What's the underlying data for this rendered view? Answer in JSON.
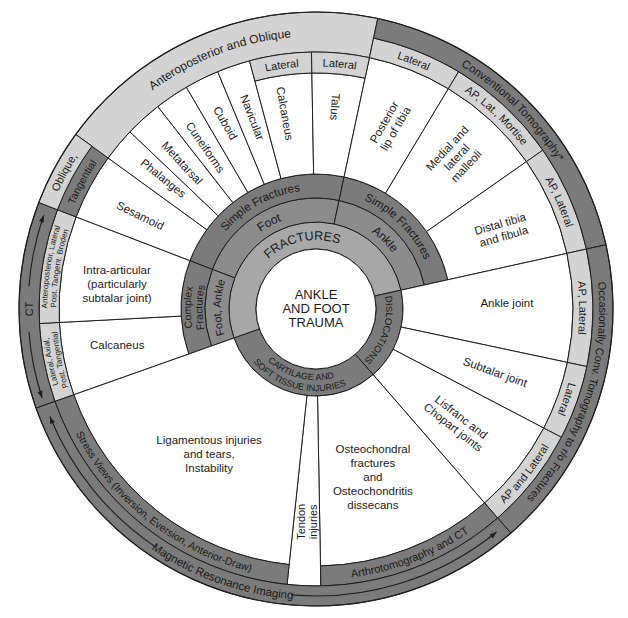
{
  "diagram": {
    "title": [
      "ANKLE",
      "AND FOOT",
      "TRAUMA"
    ],
    "colors": {
      "dark": "#7b7b7b",
      "medium": "#8c8c8c",
      "fractures": "#a7a7a7",
      "light": "#d3d3d3",
      "white": "#ffffff",
      "stroke": "#1e1e1e",
      "text": "#1a1a1a"
    },
    "injury_categories": [
      {
        "id": "fractures",
        "label": [
          "FRACTURES"
        ],
        "r": [
          "center",
          "core"
        ],
        "a": [
          250.5,
          437.5
        ],
        "fill": "fractures",
        "text": {
          "dir": "cw",
          "angle": 348,
          "size": 12.5
        }
      },
      {
        "id": "dislocations",
        "label": [
          "DISLOCATIONS"
        ],
        "r": [
          "center",
          "core"
        ],
        "a": [
          77.5,
          139
        ],
        "fill": "dark",
        "text": {
          "dir": "cw",
          "size": 9.5
        }
      },
      {
        "id": "cartilage-soft-tissue",
        "label": [
          "CARTILAGE AND",
          "SOFT TISSUE INJURIES"
        ],
        "r": [
          "center",
          "core"
        ],
        "a": [
          139,
          250.5
        ],
        "fill": "dark",
        "text": {
          "dir": "ccw",
          "angle": 194,
          "size": 9,
          "lh": 11
        }
      }
    ],
    "sites": [
      {
        "id": "foot-ankle-complex",
        "label": [
          "Foot, Ankle"
        ],
        "r": [
          "core",
          "site"
        ],
        "a": [
          250.5,
          291
        ],
        "fill": "medium",
        "text": {
          "dir": "cw",
          "size": 11
        }
      },
      {
        "id": "foot",
        "label": [
          "Foot"
        ],
        "r": [
          "core",
          "site"
        ],
        "a": [
          291,
          372
        ],
        "fill": "medium",
        "text": {
          "dir": "cw",
          "size": 12
        }
      },
      {
        "id": "ankle",
        "label": [
          "Ankle"
        ],
        "r": [
          "core",
          "site"
        ],
        "a": [
          372,
          437.5
        ],
        "fill": "medium",
        "text": {
          "dir": "cw",
          "size": 12
        }
      }
    ],
    "fracture_types": [
      {
        "id": "complex-fractures",
        "label": [
          "Complex",
          "Fractures"
        ],
        "r": [
          "site",
          "type"
        ],
        "a": [
          250.5,
          291
        ],
        "fill": "dark",
        "text": {
          "dir": "cw",
          "size": 10.5,
          "lh": 11.5
        }
      },
      {
        "id": "simple-fractures-foot",
        "label": [
          "Simple Fractures"
        ],
        "r": [
          "site",
          "type"
        ],
        "a": [
          291,
          372
        ],
        "fill": "dark",
        "text": {
          "dir": "cw",
          "size": 11.5
        }
      },
      {
        "id": "simple-fractures-ankle",
        "label": [
          "Simple Fractures"
        ],
        "r": [
          "site",
          "type"
        ],
        "a": [
          372,
          437.5
        ],
        "fill": "dark",
        "text": {
          "dir": "cw",
          "size": 11.5
        }
      }
    ],
    "injuries": [
      {
        "id": "calcaneus-complex",
        "label": [
          "Calcaneus"
        ],
        "r": [
          "type",
          "content"
        ],
        "a": [
          250.5,
          267
        ],
        "fill": "white",
        "text": {
          "mode": "rot",
          "angle": 259.75,
          "r": 202,
          "rot": 0
        }
      },
      {
        "id": "intra-articular",
        "label": [
          "Intra-articular",
          "(particularly",
          "subtalar joint)"
        ],
        "r": [
          "type",
          "content"
        ],
        "a": [
          267,
          291
        ],
        "fill": "white",
        "text": {
          "mode": "rot",
          "angle": 277.2,
          "r": 200.6,
          "rot": 0,
          "lh": 14
        }
      },
      {
        "id": "sesamoid",
        "label": [
          "Sesamoid"
        ],
        "r": [
          "type",
          "content"
        ],
        "a": [
          291,
          306
        ],
        "fill": "white",
        "text": {
          "mode": "rot",
          "angle": 298,
          "r": 199,
          "rot": 26
        }
      },
      {
        "id": "phalanges",
        "label": [
          "Phalanges"
        ],
        "r": [
          "type",
          "content"
        ],
        "a": [
          306,
          313.6
        ],
        "fill": "white",
        "text": {
          "mode": "rot",
          "angle": 310.6,
          "r": 201,
          "rot": 39
        }
      },
      {
        "id": "metatarsal",
        "label": [
          "Metatarsal"
        ],
        "r": [
          "type",
          "content"
        ],
        "a": [
          313.6,
          322
        ],
        "fill": "white",
        "text": {
          "mode": "rot",
          "angle": 317.5,
          "r": 198,
          "rot": 47
        }
      },
      {
        "id": "cuneiforms",
        "label": [
          "Cuneiforms"
        ],
        "r": [
          "type",
          "content"
        ],
        "a": [
          322,
          329.7
        ],
        "fill": "white",
        "text": {
          "mode": "rot",
          "angle": 325.6,
          "r": 196,
          "rot": 55
        }
      },
      {
        "id": "cuboid",
        "label": [
          "Cuboid"
        ],
        "r": [
          "type",
          "content"
        ],
        "a": [
          329.7,
          337.5
        ],
        "fill": "white",
        "text": {
          "mode": "rot",
          "angle": 334,
          "r": 207,
          "rot": 60
        }
      },
      {
        "id": "navicular",
        "label": [
          "Navicular"
        ],
        "r": [
          "type",
          "content"
        ],
        "a": [
          337.5,
          345
        ],
        "fill": "white",
        "text": {
          "mode": "rot",
          "angle": 341.6,
          "r": 202,
          "rot": 69
        }
      },
      {
        "id": "calcaneus",
        "label": [
          "Calcaneus"
        ],
        "r": [
          "type",
          "lat"
        ],
        "a": [
          345,
          359
        ],
        "fill": "white",
        "text": {
          "mode": "rot",
          "angle": 351,
          "r": 198,
          "rot": 80
        }
      },
      {
        "id": "talus",
        "label": [
          "Talus"
        ],
        "r": [
          "type",
          "lat"
        ],
        "a": [
          359,
          372
        ],
        "fill": "white",
        "text": {
          "mode": "rot",
          "angle": 5.4,
          "r": 203,
          "rot": 94
        }
      },
      {
        "id": "posterior-lip-of-tibia",
        "label": [
          "Posterior",
          "lip of tibia"
        ],
        "r": [
          "type",
          "content"
        ],
        "a": [
          372,
          391
        ],
        "fill": "white",
        "text": {
          "mode": "rot",
          "angle": 21.9,
          "r": 198,
          "rot": -60,
          "lh": 13
        }
      },
      {
        "id": "medial-lateral-malleoli",
        "label": [
          "Medial and",
          "lateral",
          "malleoli"
        ],
        "r": [
          "type",
          "content"
        ],
        "a": [
          391,
          415
        ],
        "fill": "white",
        "text": {
          "mode": "rot",
          "angle": 42.8,
          "r": 207,
          "rot": -47,
          "lh": 13
        }
      },
      {
        "id": "distal-tibia-fibula",
        "label": [
          "Distal tibia",
          "and fibula"
        ],
        "r": [
          "type",
          "content"
        ],
        "a": [
          415,
          437.5
        ],
        "fill": "white",
        "text": {
          "mode": "rot",
          "angle": 67,
          "r": 202,
          "rot": -16,
          "lh": 13
        }
      },
      {
        "id": "ankle-joint",
        "label": [
          "Ankle joint"
        ],
        "r": [
          "core",
          "content"
        ],
        "a": [
          77.5,
          102
        ],
        "fill": "white",
        "text": {
          "mode": "rot",
          "angle": 88.2,
          "r": 191,
          "rot": 0
        }
      },
      {
        "id": "subtalar-joint",
        "label": [
          "Subtalar joint"
        ],
        "r": [
          "core",
          "content"
        ],
        "a": [
          102,
          117.6
        ],
        "fill": "white",
        "text": {
          "mode": "rot",
          "angle": 109.4,
          "r": 190,
          "rot": 20
        }
      },
      {
        "id": "lisfranc-chopart-joints",
        "label": [
          "Lisfranc and",
          "Chopart joints"
        ],
        "r": [
          "core",
          "content"
        ],
        "a": [
          117.6,
          139
        ],
        "fill": "white",
        "text": {
          "mode": "rot",
          "angle": 128.7,
          "r": 181,
          "rot": 38,
          "lh": 13
        }
      },
      {
        "id": "osteochondral",
        "label": [
          "Osteochondral",
          "fractures",
          "and",
          "Osteochondritis",
          "dissecans"
        ],
        "r": [
          "core",
          "content"
        ],
        "a": [
          139,
          179
        ],
        "fill": "white",
        "text": {
          "mode": "rot",
          "angle": 161.3,
          "r": 177.4,
          "rot": 0,
          "lh": 14
        }
      },
      {
        "id": "tendon-injuries",
        "label": [
          "Tendon",
          "injuries"
        ],
        "r": [
          "core",
          "view"
        ],
        "a": [
          179,
          186
        ],
        "fill": "white",
        "text": {
          "mode": "rot",
          "angle": 182.4,
          "r": 213,
          "rot": -90,
          "lh": 12.5,
          "size": 11
        }
      },
      {
        "id": "ligamentous-injuries",
        "label": [
          "Ligamentous injuries",
          "and tears,",
          "Instability"
        ],
        "r": [
          "core",
          "content"
        ],
        "a": [
          186,
          250.5
        ],
        "fill": "white",
        "text": {
          "mode": "rot",
          "angle": 216.4,
          "r": 180.2,
          "rot": 0,
          "lh": 14
        }
      }
    ],
    "views": [
      {
        "id": "lateral-axial-post-tangential",
        "label": [
          "Lateral, Axial,",
          "Post. Tangential"
        ],
        "r": [
          "content",
          "view"
        ],
        "a": [
          250.5,
          267
        ],
        "fill": "light",
        "text": {
          "dir": "cw",
          "size": 8,
          "lh": 9
        }
      },
      {
        "id": "ap-lateral-broden",
        "label": [
          "Anteroposterior, Lateral",
          "Post. Tangent. Broden"
        ],
        "r": [
          "content",
          "view"
        ],
        "a": [
          267,
          291
        ],
        "fill": "light",
        "text": {
          "dir": "cw",
          "size": 8,
          "lh": 9
        }
      },
      {
        "id": "tangential",
        "label": [
          "Tangential"
        ],
        "r": [
          "content",
          "view"
        ],
        "a": [
          291,
          306
        ],
        "fill": "dark",
        "text": {
          "dir": "cw",
          "size": 10.5
        }
      },
      {
        "id": "anteroposterior-oblique",
        "label": [
          "Anteroposterior and Oblique"
        ],
        "r": [
          "content",
          "outer"
        ],
        "a": [
          306,
          372
        ],
        "fill": "light",
        "text": {
          "dir": "cw",
          "size": 12
        }
      },
      {
        "id": "lateral-calcaneus",
        "label": [
          "Lateral"
        ],
        "r": [
          "lat",
          "content"
        ],
        "a": [
          345,
          359
        ],
        "fill": "light",
        "text": {
          "dir": "cw",
          "size": 11
        }
      },
      {
        "id": "lateral-talus",
        "label": [
          "Lateral"
        ],
        "r": [
          "lat",
          "content"
        ],
        "a": [
          359,
          372
        ],
        "fill": "light",
        "text": {
          "dir": "cw",
          "size": 11
        }
      },
      {
        "id": "lateral-posterior-lip",
        "label": [
          "Lateral"
        ],
        "r": [
          "content",
          "view"
        ],
        "a": [
          372,
          391
        ],
        "fill": "light",
        "text": {
          "dir": "cw",
          "size": 11
        }
      },
      {
        "id": "ap-lat-mortise",
        "label": [
          "AP, Lat., Mortise"
        ],
        "r": [
          "content",
          "view"
        ],
        "a": [
          391,
          415
        ],
        "fill": "light",
        "text": {
          "dir": "cw",
          "size": 11
        }
      },
      {
        "id": "ap-lateral-distal",
        "label": [
          "AP, Lateral"
        ],
        "r": [
          "content",
          "view"
        ],
        "a": [
          415,
          437.5
        ],
        "fill": "light",
        "text": {
          "dir": "cw",
          "size": 11
        }
      },
      {
        "id": "ap-lateral-ankle-joint",
        "label": [
          "AP, Lateral"
        ],
        "r": [
          "content",
          "view"
        ],
        "a": [
          77.5,
          102
        ],
        "fill": "light",
        "text": {
          "dir": "cw",
          "size": 11
        }
      },
      {
        "id": "lateral-subtalar",
        "label": [
          "Lateral"
        ],
        "r": [
          "content",
          "view"
        ],
        "a": [
          102,
          117.6
        ],
        "fill": "light",
        "text": {
          "dir": "cw",
          "size": 11
        }
      },
      {
        "id": "ap-and-lateral",
        "label": [
          "AP and Lateral"
        ],
        "r": [
          "content",
          "view"
        ],
        "a": [
          117.6,
          139
        ],
        "fill": "light",
        "text": {
          "dir": "ccw",
          "size": 11
        }
      },
      {
        "id": "arthrotomography-ct",
        "label": [
          "Arthrotomography and CT"
        ],
        "r": [
          "content",
          "view"
        ],
        "a": [
          139,
          179
        ],
        "fill": "dark",
        "text": {
          "dir": "ccw",
          "size": 11
        }
      },
      {
        "id": "stress-views",
        "label": [
          "Stress Views (Inversion, Eversion, Anterior-Draw)"
        ],
        "r": [
          "content",
          "view"
        ],
        "a": [
          186,
          250.5
        ],
        "fill": "dark",
        "text": {
          "dir": "ccw",
          "size": 10.5
        }
      }
    ],
    "modalities": [
      {
        "id": "ct",
        "label": [
          "CT"
        ],
        "r": [
          "view",
          "outer"
        ],
        "a": [
          250.5,
          291
        ],
        "fill": "dark",
        "text": {
          "dir": "cw",
          "angle": 270,
          "size": 11
        },
        "arrow": {
          "r": 288,
          "segments": [
            [
              252,
              265.5
            ],
            [
              274.5,
              289
            ]
          ],
          "heads": [
            [
              252,
              -1
            ],
            [
              289,
              1
            ]
          ]
        }
      },
      {
        "id": "oblique",
        "label": [
          "Oblique,"
        ],
        "r": [
          "view",
          "outer"
        ],
        "a": [
          291,
          306
        ],
        "fill": "light",
        "text": {
          "dir": "cw",
          "size": 11
        }
      },
      {
        "id": "conventional-tomography",
        "label": [
          "Conventional Tomography*"
        ],
        "r": [
          "view",
          "outer"
        ],
        "a": [
          12,
          77.5
        ],
        "fill": "dark",
        "text": {
          "dir": "cw",
          "size": 11.5
        }
      },
      {
        "id": "occasionally-conv-tomography",
        "label": [
          "Occasionally Conv. Tomography to r/o Fractures"
        ],
        "r": [
          "view",
          "outer"
        ],
        "a": [
          77.5,
          139
        ],
        "fill": "dark",
        "text": {
          "dir": "cw",
          "size": 11
        }
      },
      {
        "id": "magnetic-resonance-imaging",
        "label": [
          "Magnetic Resonance Imaging"
        ],
        "r": [
          "view",
          "outer"
        ],
        "a": [
          139,
          250.5
        ],
        "fill": "dark",
        "text": {
          "dir": "ccw",
          "angle": 199.5,
          "size": 11.5
        },
        "arrow": {
          "r": 287,
          "segments": [
            [
              141,
              185
            ],
            [
              214,
              248
            ]
          ],
          "heads": [
            [
              141,
              -1
            ],
            [
              248,
              1
            ]
          ]
        }
      }
    ]
  }
}
